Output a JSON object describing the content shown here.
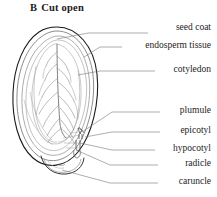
{
  "figure": {
    "panel_letter": "B",
    "title": "Cut open"
  },
  "colors": {
    "seed_coat_line": "#1a1a1a",
    "inner_line": "#6b6b6b",
    "vein_line": "#888888",
    "leader_line": "#777777",
    "text": "#1d1d1d",
    "background": "#ffffff"
  },
  "labels": [
    {
      "id": "seed-coat",
      "text": "seed coat",
      "text_x": 211,
      "text_y": 28,
      "leader_start_x": 148,
      "leader_start_y": 33,
      "leader_mid_x": 88,
      "leader_mid_y": 33,
      "target_x": 57,
      "target_y": 39
    },
    {
      "id": "endosperm-tissue",
      "text": "endosperm tissue",
      "text_x": 211,
      "text_y": 43,
      "leader_start_x": 122,
      "leader_start_y": 47,
      "leader_mid_x": 100,
      "leader_mid_y": 47,
      "target_x": 84,
      "target_y": 57
    },
    {
      "id": "cotyledon",
      "text": "cotyledon",
      "text_x": 211,
      "text_y": 66,
      "leader_start_x": 155,
      "leader_start_y": 71,
      "leader_mid_x": 100,
      "leader_mid_y": 71,
      "target_x": 78,
      "target_y": 75
    },
    {
      "id": "plumule",
      "text": "plumule",
      "text_x": 211,
      "text_y": 107,
      "leader_start_x": 160,
      "leader_start_y": 112,
      "leader_mid_x": 112,
      "leader_mid_y": 112,
      "target_x": 82,
      "target_y": 132
    },
    {
      "id": "epicotyl",
      "text": "epicotyl",
      "text_x": 211,
      "text_y": 127,
      "leader_start_x": 160,
      "leader_start_y": 132,
      "leader_mid_x": 112,
      "leader_mid_y": 132,
      "target_x": 85,
      "target_y": 137
    },
    {
      "id": "hypocotyl",
      "text": "hypocotyl",
      "text_x": 211,
      "text_y": 145,
      "leader_start_x": 155,
      "leader_start_y": 150,
      "leader_mid_x": 112,
      "leader_mid_y": 150,
      "target_x": 80,
      "target_y": 143
    },
    {
      "id": "radicle",
      "text": "radicle",
      "text_x": 211,
      "text_y": 160,
      "leader_start_x": 158,
      "leader_start_y": 165,
      "leader_mid_x": 110,
      "leader_mid_y": 165,
      "target_x": 76,
      "target_y": 150
    },
    {
      "id": "caruncle",
      "text": "caruncle",
      "text_x": 211,
      "text_y": 178,
      "leader_start_x": 158,
      "leader_start_y": 183,
      "leader_mid_x": 110,
      "leader_mid_y": 183,
      "target_x": 62,
      "target_y": 170
    }
  ],
  "structures": {
    "seed_coat": "outer double-contour oval outline of the seed",
    "endosperm": "inner oval contour inside the seed coat",
    "cotyledon": "broad leaf-like blade with a central midrib and branching lateral veins",
    "embryo_axis": "small axis at the base bearing plumule, epicotyl, hypocotyl and radicle",
    "caruncle": "small lobed outgrowth at the bottom of the seed"
  }
}
